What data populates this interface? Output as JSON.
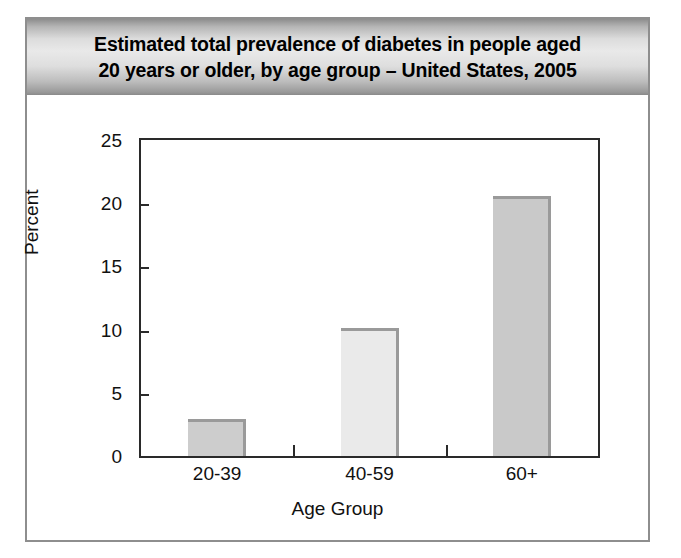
{
  "figure": {
    "title_line_1": "Estimated total prevalence of diabetes in people aged",
    "title_line_2": "20 years or older, by age group – United States, 2005"
  },
  "chart_data": {
    "type": "bar",
    "title": "Estimated total prevalence of diabetes in people aged 20 years or older, by age group – United States, 2005",
    "categories": [
      "20-39",
      "40-59",
      "60+"
    ],
    "values": [
      2.9,
      10.1,
      20.6
    ],
    "xlabel": "Age Group",
    "ylabel": "Percent",
    "ylim": [
      0,
      25
    ],
    "yticks": [
      0,
      5,
      10,
      15,
      20,
      25
    ],
    "ytick_labels": [
      "0",
      "5",
      "10",
      "15",
      "20",
      "25"
    ],
    "grid": false,
    "legend": false,
    "bar_colors": [
      "#cdcdcd",
      "#eaeaea",
      "#c9c9c9"
    ],
    "bar_shadow_color": "#9a9a9a",
    "axis_color": "#2a2a2a",
    "plot_background": "#ffffff"
  },
  "bleed_text": {
    "line_1": "are not",
    "line_2": "sed to",
    "line_3": "rimary",
    "line_4": "th the",
    "line_5": "Aged",
    "line_6": "abetes"
  }
}
